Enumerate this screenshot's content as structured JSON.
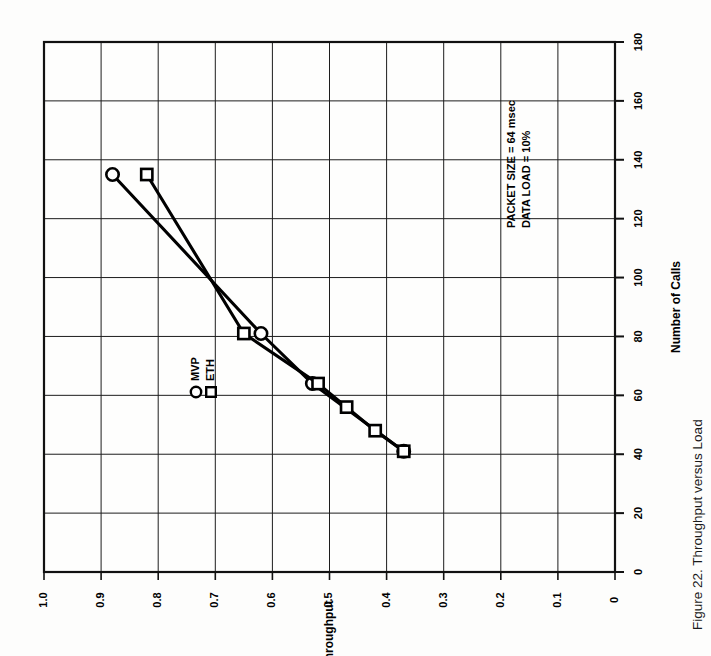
{
  "figure": {
    "caption": "Figure 22.  Throughput versus Load",
    "caption_number": "Figure 22.",
    "caption_title": "Throughput versus Load",
    "orientation": "rotated-90-ccw",
    "annotation_lines": [
      "PACKET SIZE = 64 msec",
      "DATA LOAD = 10%"
    ]
  },
  "legend": {
    "items": [
      {
        "marker": "circle-marker",
        "label": "MVP"
      },
      {
        "marker": "square-marker",
        "label": "ETH"
      }
    ]
  },
  "chart_data": {
    "type": "line",
    "title": "Throughput versus Load",
    "xlabel": "Number of Calls",
    "ylabel": "Throughput",
    "xlim": [
      0,
      180
    ],
    "ylim": [
      0,
      1.0
    ],
    "xticks": [
      0,
      20,
      40,
      60,
      80,
      100,
      120,
      140,
      160,
      180
    ],
    "xtick_labels": [
      "0",
      "20",
      "40",
      "60",
      "80",
      "100",
      "120",
      "140",
      "160",
      "180"
    ],
    "yticks": [
      0,
      0.1,
      0.2,
      0.3,
      0.4,
      0.5,
      0.6,
      0.7,
      0.8,
      0.9,
      1.0
    ],
    "ytick_labels": [
      "0",
      "0.1",
      "0.2",
      "0.3",
      "0.4",
      "0.5",
      "0.6",
      "0.7",
      "0.8",
      "0.9",
      "1.0"
    ],
    "grid": true,
    "legend_position": "inside-left",
    "annotations": [
      "PACKET SIZE = 64 msec",
      "DATA LOAD = 10%"
    ],
    "series": [
      {
        "name": "MVP",
        "marker": "circle",
        "x": [
          41,
          64,
          81,
          135
        ],
        "y": [
          0.37,
          0.53,
          0.62,
          0.88
        ]
      },
      {
        "name": "ETH",
        "marker": "square",
        "x": [
          41,
          48,
          56,
          64,
          81,
          135
        ],
        "y": [
          0.37,
          0.42,
          0.47,
          0.52,
          0.65,
          0.82
        ]
      }
    ]
  }
}
